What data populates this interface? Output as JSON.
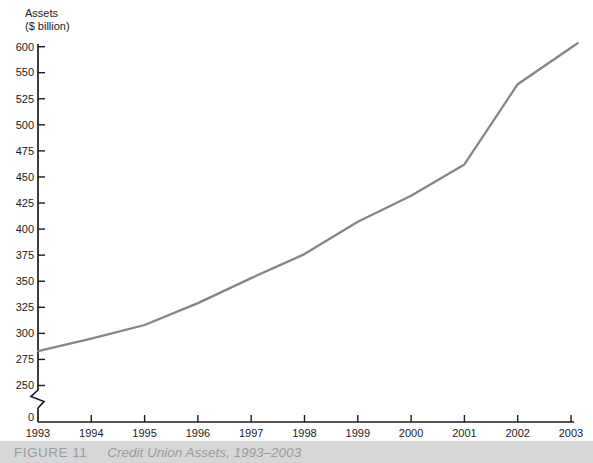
{
  "y_axis_title": {
    "line1": "Assets",
    "line2": "($ billion)"
  },
  "caption": {
    "label": "FIGURE 11",
    "title": "Credit Union Assets, 1993–2003"
  },
  "colors": {
    "background": "#ffffff",
    "line": "#858585",
    "axis": "#1c1c1c",
    "tick_text": "#1b1b1b",
    "caption_bg": "#d7d7d7",
    "caption_text": "#989da0"
  },
  "chart_data": {
    "type": "line",
    "title": "Credit Union Assets, 1993–2003",
    "ylabel": "Assets ($ billion)",
    "xlabel": "",
    "x": [
      1993,
      1994,
      1995,
      1996,
      1997,
      1998,
      1999,
      2000,
      2001,
      2002,
      2003
    ],
    "values": [
      283,
      295,
      308,
      329,
      353,
      376,
      407,
      432,
      462,
      539,
      598
    ],
    "x_tick_labels": [
      "1993",
      "1994",
      "1995",
      "1996",
      "1997",
      "1998",
      "1999",
      "2000",
      "2001",
      "2002",
      "2003"
    ],
    "y_ticks": [
      600,
      550,
      525,
      500,
      475,
      450,
      425,
      400,
      375,
      350,
      325,
      300,
      275,
      250
    ],
    "y_origin_label": "0",
    "y_axis_break": true,
    "ylim_display": [
      250,
      600
    ],
    "grid": false,
    "legend": "none",
    "series_name": "Credit union assets"
  }
}
